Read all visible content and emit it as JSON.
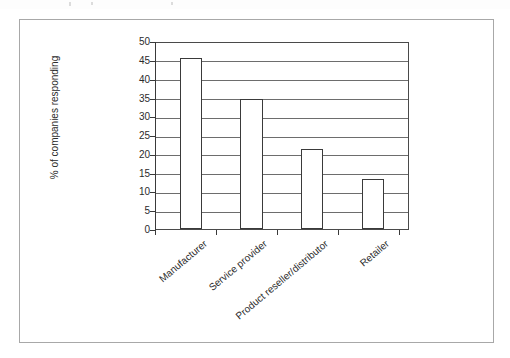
{
  "figure": {
    "frame_color": "#a8a8a8",
    "background": "#ffffff"
  },
  "chart_data": {
    "type": "bar",
    "title": "",
    "subtitle": "",
    "xlabel": "",
    "ylabel": "% of companies responding",
    "categories": [
      "Manufacturer",
      "Service provider",
      "Product reseller/distributor",
      "Retailer"
    ],
    "values": [
      46,
      35,
      21.5,
      13.5
    ],
    "ylim": [
      0,
      50
    ],
    "ytick_values": [
      0,
      5,
      10,
      15,
      20,
      25,
      30,
      35,
      40,
      45,
      50
    ],
    "ytick_labels": [
      "0",
      "5",
      "10",
      "15",
      "20",
      "25",
      "30",
      "35",
      "40",
      "45",
      "50"
    ],
    "grid": true,
    "grid_axis": "y",
    "legend": false,
    "legend_position": "none",
    "bar_fill": "#ffffff",
    "bar_edge": "#3a3a3a",
    "axis_color": "#3a3a3a",
    "grid_color": "#6d6d6d",
    "xtick_label_rotation": -40
  }
}
